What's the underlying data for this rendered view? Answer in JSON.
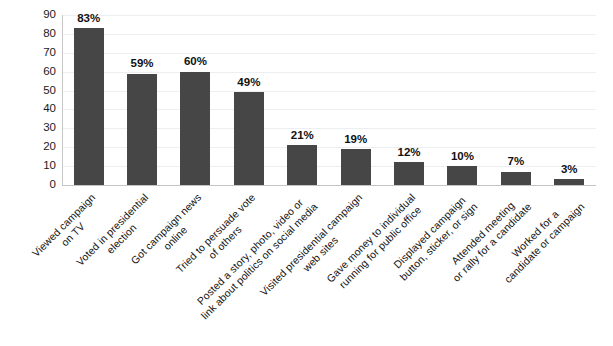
{
  "chart_data": {
    "type": "bar",
    "title": "",
    "subtitle": "",
    "xlabel": "",
    "ylabel": "",
    "ylim": [
      0,
      90
    ],
    "ytick_step": 10,
    "yticks": [
      "90",
      "80",
      "70",
      "60",
      "50",
      "40",
      "30",
      "20",
      "10",
      "0"
    ],
    "grid": true,
    "legend": "none",
    "bar_color": "#464646",
    "gridline_color": "#eceff1",
    "axis_color": "#c9c9c9",
    "categories": [
      "Viewed campaign\non TV",
      "Voted in presidential\nelection",
      "Got campaign news\nonline",
      "Tried to persuade vote\nof others",
      "Posted a story, photo, video or\nlink about politics on social media",
      "Visited presidential campaign\nweb sites",
      "Gave money to individual\nrunning for public office",
      "Displayed campaign\nbutton, sticker, or sign",
      "Attended meeting\nor rally for a candidate",
      "Worked for a\ncandidate or campaign"
    ],
    "category_lines": [
      [
        "Viewed campaign",
        "on TV"
      ],
      [
        "Voted in presidential",
        "election"
      ],
      [
        "Got campaign news",
        "online"
      ],
      [
        "Tried to persuade vote",
        "of others"
      ],
      [
        "Posted a story, photo, video or",
        "link about politics on social media"
      ],
      [
        "Visited presidential campaign",
        "web sites"
      ],
      [
        "Gave money to individual",
        "running for public office"
      ],
      [
        "Displayed campaign",
        "button, sticker, or sign"
      ],
      [
        "Attended meeting",
        "or rally for a candidate"
      ],
      [
        "Worked for a",
        "candidate or campaign"
      ]
    ],
    "values": [
      83,
      59,
      60,
      49,
      21,
      19,
      12,
      10,
      7,
      3
    ],
    "data_labels": [
      "83%",
      "59%",
      "60%",
      "49%",
      "21%",
      "19%",
      "12%",
      "10%",
      "7%",
      "3%"
    ]
  }
}
